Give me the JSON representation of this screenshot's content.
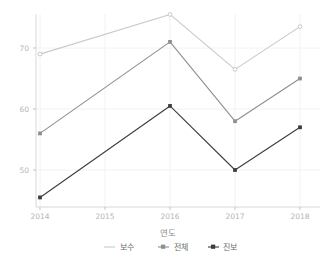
{
  "chart_data": {
    "type": "line",
    "title": "",
    "xlabel": "연도",
    "ylabel": "",
    "x": [
      2014,
      2015,
      2016,
      2017,
      2018
    ],
    "categories": [
      "2014",
      "2015",
      "2016",
      "2017",
      "2018"
    ],
    "xlim": [
      2013.8,
      2018.2
    ],
    "ylim": [
      44.0,
      77.0
    ],
    "yticks": [
      50,
      60,
      70
    ],
    "ytick_labels": [
      "50",
      "60",
      "70"
    ],
    "xticks": [
      2014,
      2015,
      2016,
      2017,
      2018
    ],
    "xtick_labels": [
      "2014",
      "2015",
      "2016",
      "2017",
      "2018"
    ],
    "grid": true,
    "grid_color": "#f2f2f2",
    "legend_position": "bottom",
    "background": "#ffffff",
    "series": [
      {
        "name": "보수",
        "color": "#c9c9c9",
        "marker": "circle",
        "x": [
          2014,
          2016,
          2017,
          2018
        ],
        "values": [
          69.0,
          75.5,
          66.5,
          73.5
        ],
        "labels": [
          "69.0",
          "75.5",
          "66.5",
          "73.5"
        ]
      },
      {
        "name": "전체",
        "color": "#8f8f8f",
        "marker": "square",
        "x": [
          2014,
          2016,
          2017,
          2018
        ],
        "values": [
          56.0,
          71.0,
          58.0,
          65.0
        ],
        "labels": [
          "56.0",
          "71.0",
          "58.0",
          "65.0"
        ]
      },
      {
        "name": "진보",
        "color": "#3d3d3d",
        "marker": "square",
        "x": [
          2014,
          2016,
          2017,
          2018
        ],
        "values": [
          45.5,
          60.5,
          50.0,
          57.0
        ],
        "labels": [
          "45.5",
          "60.5",
          "50.0",
          "57.0"
        ]
      }
    ]
  },
  "axis": {
    "ytick_0": "50",
    "ytick_1": "60",
    "ytick_2": "70",
    "xtick_0": "2014",
    "xtick_1": "2015",
    "xtick_2": "2016",
    "xtick_3": "2017",
    "xtick_4": "2018",
    "xlabel": "연도"
  },
  "legend": {
    "items": [
      {
        "label": "보수",
        "color": "#c9c9c9"
      },
      {
        "label": "전체",
        "color": "#8f8f8f"
      },
      {
        "label": "진보",
        "color": "#3d3d3d"
      }
    ]
  }
}
